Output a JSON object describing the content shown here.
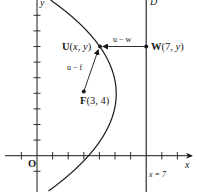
{
  "figure": {
    "type": "parabola-focus-directrix",
    "colors": {
      "ink": "#1a1a1a",
      "background": "#ffffff"
    },
    "axes": {
      "x_label": "x",
      "y_label": "y",
      "origin_label": "O",
      "unit_px": 15.6,
      "origin_px": [
        37,
        155.7
      ],
      "x_ticks": [
        -2,
        -1,
        1,
        2,
        3,
        4,
        5,
        6,
        7,
        8,
        9
      ],
      "y_ticks": [
        -1,
        1,
        2,
        3,
        4,
        5,
        6,
        7,
        8,
        9
      ]
    },
    "directrix": {
      "label": "D",
      "equation_label": "x = 7",
      "x": 7
    },
    "focus": {
      "label_bold": "F",
      "label_rest": "(3, 4)",
      "x": 3,
      "y": 4
    },
    "point_u": {
      "label_bold": "U",
      "label_rest_open": "(",
      "label_x": "x",
      "label_sep": ", ",
      "label_y": "y",
      "label_close": ")",
      "x": 5.18,
      "y": 7
    },
    "point_w": {
      "label_bold": "W",
      "label_rest_open": "(7, ",
      "label_y": "y",
      "label_close": ")",
      "x": 7,
      "y": 7
    },
    "vectors": [
      {
        "label": "u − w",
        "from": "W",
        "to": "U"
      },
      {
        "label": "u − f",
        "from": "F",
        "to": "U"
      }
    ],
    "curve": {
      "equation": "(y − 4)² = −8(x − 5)",
      "vertex": [
        5,
        4
      ]
    }
  }
}
